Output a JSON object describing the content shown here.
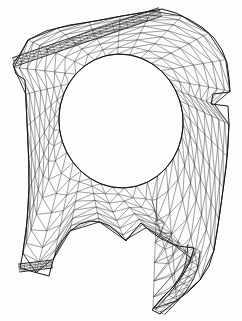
{
  "figure": {
    "title": "Triangulated finite element mesh",
    "kind": "mesh-diagram",
    "width": 242,
    "height": 321,
    "background_color": "#fdfdfd",
    "edge_color": "#2b2b2b",
    "boundary_color": "#141414",
    "edge_width_thin": 0.45,
    "edge_width_bold": 0.95
  },
  "chart_data": {
    "type": "mesh",
    "title": "Triangulated finite element mesh",
    "xlabel": "",
    "ylabel": "",
    "xlim": [
      0,
      242
    ],
    "ylim": [
      0,
      321
    ],
    "grid": false,
    "legend": [],
    "annotations": [],
    "mesh": {
      "element_type": "triangle",
      "band_divisions_across": 7,
      "band_divisions_along": 34,
      "outer_boundary": [
        [
          28,
          40
        ],
        [
          46,
          31
        ],
        [
          70,
          25
        ],
        [
          96,
          21
        ],
        [
          122,
          16
        ],
        [
          146,
          12
        ],
        [
          162,
          9
        ],
        [
          176,
          13
        ],
        [
          190,
          20
        ],
        [
          203,
          28
        ],
        [
          214,
          38
        ],
        [
          222,
          50
        ],
        [
          227,
          63
        ],
        [
          229,
          78
        ],
        [
          230,
          92
        ],
        [
          213,
          94
        ],
        [
          211,
          104
        ],
        [
          228,
          106
        ],
        [
          229,
          124
        ],
        [
          228,
          146
        ],
        [
          226,
          168
        ],
        [
          223,
          190
        ],
        [
          220,
          212
        ],
        [
          217,
          232
        ],
        [
          214,
          250
        ],
        [
          209,
          266
        ],
        [
          200,
          280
        ],
        [
          188,
          292
        ],
        [
          176,
          301
        ],
        [
          166,
          309
        ],
        [
          160,
          314
        ],
        [
          152,
          310
        ],
        [
          160,
          300
        ],
        [
          172,
          288
        ],
        [
          182,
          276
        ],
        [
          190,
          262
        ],
        [
          194,
          248
        ],
        [
          186,
          247
        ],
        [
          178,
          246
        ],
        [
          170,
          243
        ],
        [
          160,
          238
        ],
        [
          150,
          231
        ],
        [
          141,
          223
        ],
        [
          133,
          232
        ],
        [
          126,
          241
        ],
        [
          118,
          233
        ],
        [
          110,
          226
        ],
        [
          100,
          222
        ],
        [
          90,
          221
        ],
        [
          80,
          224
        ],
        [
          70,
          231
        ],
        [
          62,
          241
        ],
        [
          56,
          252
        ],
        [
          52,
          264
        ],
        [
          49,
          276
        ],
        [
          34,
          272
        ],
        [
          20,
          268
        ],
        [
          23,
          252
        ],
        [
          26,
          232
        ],
        [
          28,
          210
        ],
        [
          29,
          188
        ],
        [
          29,
          166
        ],
        [
          28,
          144
        ],
        [
          27,
          122
        ],
        [
          26,
          100
        ],
        [
          25,
          80
        ],
        [
          16,
          74
        ],
        [
          13,
          64
        ],
        [
          20,
          54
        ]
      ],
      "hole_boundary": {
        "shape": "ellipse",
        "center": [
          121,
          121
        ],
        "radius_x": 62,
        "radius_y": 67,
        "rotation_deg": -8,
        "samples": 64
      },
      "flange_strips": [
        {
          "name": "upper-left-flange",
          "start": [
            14,
            62
          ],
          "end": [
            160,
            12
          ],
          "thickness": 9,
          "rows": 3
        },
        {
          "name": "lower-left-flange",
          "start": [
            19,
            268
          ],
          "end": [
            52,
            264
          ],
          "thickness": 8,
          "rows": 3
        }
      ],
      "notches": [
        {
          "name": "right-edge-notch",
          "x": 211,
          "y": 94,
          "w": 19,
          "h": 12
        },
        {
          "name": "bottom-centre-v-notch",
          "apex": [
            133,
            232
          ],
          "left": [
            141,
            223
          ],
          "right": [
            126,
            241
          ]
        }
      ],
      "tail": {
        "name": "lower-right-tail",
        "from": [
          194,
          248
        ],
        "to": [
          160,
          312
        ],
        "width": 14
      }
    }
  }
}
